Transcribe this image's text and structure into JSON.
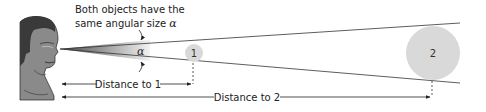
{
  "figure": {
    "caption_line1": "Both objects have the",
    "caption_line2": "same angular size",
    "angle_symbol": "α",
    "angle_label": "α",
    "objects": [
      {
        "label": "1",
        "name": "object-1"
      },
      {
        "label": "2",
        "name": "object-2"
      }
    ],
    "distance_1_label": "Distance to 1",
    "distance_2_label": "Distance to 2",
    "colors": {
      "object_fill": "#d9d9d9",
      "line": "#333333",
      "face": "#8a8a8a",
      "hair": "#3a3a3a",
      "cone_dark": "#555555",
      "cone_light": "#f0f0f0"
    }
  }
}
